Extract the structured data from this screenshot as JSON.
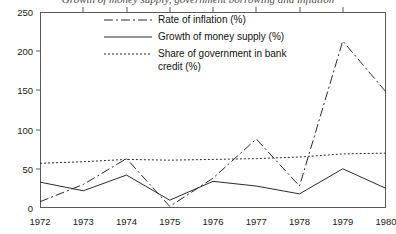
{
  "chart_data": {
    "type": "line",
    "title": "Growth of money supply, government borrowing and inflation",
    "xlabel": "",
    "ylabel": "",
    "x": [
      1972,
      1973,
      1974,
      1975,
      1976,
      1977,
      1978,
      1979,
      1980
    ],
    "xtick_labels": [
      "1972",
      "1973",
      "1974",
      "1975",
      "1976",
      "1977",
      "1978",
      "1979",
      "1980"
    ],
    "ytick_labels": [
      "0",
      "50",
      "100",
      "150",
      "200",
      "250"
    ],
    "yticks": [
      0,
      50,
      100,
      150,
      200,
      250
    ],
    "xlim": [
      1972,
      1980
    ],
    "ylim": [
      0,
      250
    ],
    "grid": false,
    "legend_position": "top-center",
    "series": [
      {
        "name": "Rate of inflation (%)",
        "style": "dash-dot",
        "color": "#2b2b2b",
        "values": [
          8,
          30,
          63,
          2,
          38,
          88,
          28,
          213,
          148
        ]
      },
      {
        "name": "Growth of money supply (%)",
        "style": "solid",
        "color": "#2b2b2b",
        "values": [
          33,
          22,
          42,
          10,
          34,
          28,
          18,
          50,
          25
        ]
      },
      {
        "name": "Share of government in bank\ncredit (%)",
        "style": "dotted",
        "color": "#2b2b2b",
        "values": [
          57,
          59,
          62,
          61,
          62,
          63,
          65,
          69,
          70
        ]
      }
    ]
  }
}
